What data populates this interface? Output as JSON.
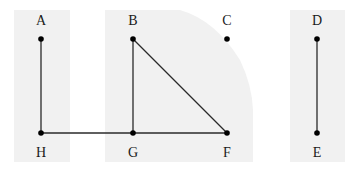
{
  "diagram": {
    "background": "#ffffff",
    "panel_color": "#f1f1f1",
    "line_color": "#2a2a2a",
    "point_color": "#000000",
    "panels": [
      {
        "id": "left",
        "x": 14,
        "y": 10,
        "w": 56,
        "h": 152
      },
      {
        "id": "middle",
        "x": 105,
        "y": 10,
        "w": 148,
        "h": 152
      },
      {
        "id": "right",
        "x": 290,
        "y": 10,
        "w": 55,
        "h": 152
      }
    ],
    "points": [
      {
        "name": "A",
        "x": 41,
        "y": 39,
        "label_pos": "above"
      },
      {
        "name": "B",
        "x": 133,
        "y": 39,
        "label_pos": "above"
      },
      {
        "name": "C",
        "x": 227,
        "y": 39,
        "label_pos": "above"
      },
      {
        "name": "D",
        "x": 317,
        "y": 39,
        "label_pos": "above"
      },
      {
        "name": "H",
        "x": 41,
        "y": 133,
        "label_pos": "below"
      },
      {
        "name": "G",
        "x": 133,
        "y": 133,
        "label_pos": "below"
      },
      {
        "name": "F",
        "x": 227,
        "y": 133,
        "label_pos": "below"
      },
      {
        "name": "E",
        "x": 317,
        "y": 133,
        "label_pos": "below"
      }
    ],
    "segments": [
      {
        "from": "A",
        "to": "H"
      },
      {
        "from": "H",
        "to": "G"
      },
      {
        "from": "G",
        "to": "F"
      },
      {
        "from": "B",
        "to": "G"
      },
      {
        "from": "B",
        "to": "F"
      },
      {
        "from": "D",
        "to": "E"
      }
    ],
    "labels": {
      "A": "A",
      "B": "B",
      "C": "C",
      "D": "D",
      "E": "E",
      "F": "F",
      "G": "G",
      "H": "H"
    }
  }
}
